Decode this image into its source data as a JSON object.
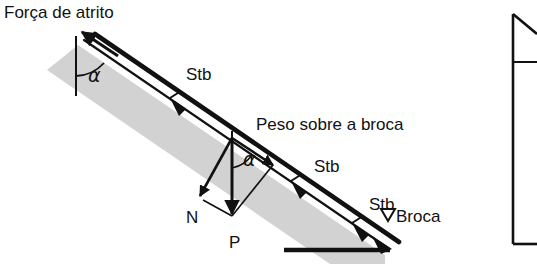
{
  "figure": {
    "name": "diagrama-forcas-poco-direcional",
    "language": "pt-BR",
    "width": 537,
    "height": 264,
    "background_color": "#ffffff",
    "line_color": "#111111",
    "borehole_fill_color": "#d2d2d2"
  },
  "labels": {
    "friction_force": "Força de atrito",
    "weight_on_bit": "Peso sobre a broca",
    "normal_force": "N",
    "weight": "P",
    "angle_top": "α",
    "angle_mid": "α",
    "bit": "Broca",
    "stabilizer_1": "Stb",
    "stabilizer_2": "Stb",
    "stabilizer_3": "Stb"
  },
  "stabilizers": [
    {
      "label": "Stb",
      "label_x": 186,
      "label_y": 80,
      "marker_x": 182,
      "marker_y": 108
    },
    {
      "label": "Stb",
      "label_x": 314,
      "label_y": 172,
      "marker_x": 303,
      "marker_y": 200
    },
    {
      "label": "Stb",
      "label_x": 369,
      "label_y": 210,
      "marker_x": 360,
      "marker_y": 238
    }
  ],
  "vectors": [
    {
      "name": "friction-force-vector",
      "label": "Força de atrito",
      "direction": "up-slope",
      "label_x": 4,
      "label_y": 18
    },
    {
      "name": "weight-on-bit-vector",
      "label": "Peso sobre a broca",
      "direction": "down-slope",
      "label_x": 256,
      "label_y": 130
    },
    {
      "name": "normal-force-vector",
      "label": "N",
      "direction": "perpendicular-to-borehole",
      "label_x": 186,
      "label_y": 223
    },
    {
      "name": "weight-vector",
      "label": "P",
      "direction": "vertical-down",
      "label_x": 229,
      "label_y": 248
    }
  ],
  "annotations": {
    "bit_marker_symbol": "▽",
    "bit_label": "Broca",
    "bit_label_x": 396,
    "bit_label_y": 222
  }
}
